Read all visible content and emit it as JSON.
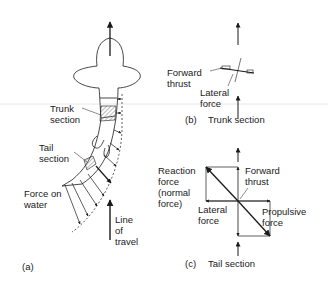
{
  "figure": {
    "panel_a": {
      "caption": "(a)",
      "labels": {
        "trunk_section": "Trunk\nsection",
        "tail_section": "Tail\nsection",
        "force_on_water": "Force on\nwater",
        "line_of_travel": "Line\nof\ntravel"
      }
    },
    "panel_b": {
      "caption_letter": "(b)",
      "caption_title": "Trunk section",
      "labels": {
        "forward_thrust": "Forward\nthrust",
        "lateral_force": "Lateral\nforce"
      }
    },
    "panel_c": {
      "caption_letter": "(c)",
      "caption_title": "Tail section",
      "labels": {
        "reaction_force": "Reaction\nforce\n(normal\nforce)",
        "forward_thrust": "Forward\nthrust",
        "lateral_force": "Lateral\nforce",
        "propulsive_force": "Propulsive\nforce"
      }
    },
    "colors": {
      "line": "#1a1a1a",
      "hatch": "#888888",
      "background": "#ffffff",
      "scan_line": "#e6e6e6"
    }
  }
}
